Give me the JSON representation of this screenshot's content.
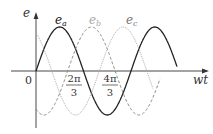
{
  "chart_data": {
    "type": "line",
    "title": "",
    "xlabel": "wt",
    "ylabel": "e",
    "origin_label": "0",
    "x_ticks": [
      {
        "num": "2π",
        "den": "3",
        "value": 2.0944
      },
      {
        "num": "4π",
        "den": "3",
        "value": 4.1888
      }
    ],
    "series": [
      {
        "name": "e_a",
        "label_main": "e",
        "label_sub": "a",
        "phase": 0,
        "style": "solid",
        "color": "#222222"
      },
      {
        "name": "e_b",
        "label_main": "e",
        "label_sub": "b",
        "phase": -2.0944,
        "style": "dashed",
        "color": "#8c8c8c"
      },
      {
        "name": "e_c",
        "label_main": "e",
        "label_sub": "c",
        "phase": 2.0944,
        "style": "dotted",
        "color": "#aaaaaa"
      }
    ],
    "x_range_rad": [
      0,
      4.4
    ],
    "amplitude": 1
  }
}
